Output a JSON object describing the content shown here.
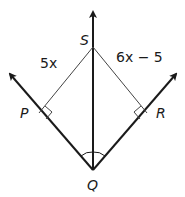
{
  "diagram": {
    "type": "geometry-angle-bisector",
    "points": {
      "S": "S",
      "P": "P",
      "R": "R",
      "Q": "Q"
    },
    "segments": {
      "SP": "5x",
      "SR": "6x − 5"
    },
    "colors": {
      "ray": "#1a1a1a",
      "segment": "#444444",
      "background": "#ffffff"
    },
    "marks": [
      "right-angle-at-P",
      "right-angle-at-R",
      "congruent-angles-at-Q"
    ]
  }
}
